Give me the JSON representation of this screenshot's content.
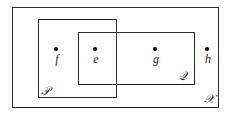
{
  "diagram": {
    "type": "set-venn-rectangles",
    "background_color": "#ffffff",
    "stroke_color": "#2b2b2b",
    "text_color": "#1c1c1c",
    "sets": [
      {
        "id": "universe",
        "label": "𝒳",
        "label_plain": "X",
        "label_position": "bottom-right-inside"
      },
      {
        "id": "p",
        "label": "𝒫",
        "label_plain": "P",
        "label_position": "bottom-left-inside"
      },
      {
        "id": "q",
        "label": "𝒬",
        "label_plain": "Q",
        "label_position": "bottom-right-inside"
      }
    ],
    "points": [
      {
        "id": "f",
        "label": "f",
        "membership": "P only"
      },
      {
        "id": "e",
        "label": "e",
        "membership": "P and Q"
      },
      {
        "id": "g",
        "label": "g",
        "membership": "Q only"
      },
      {
        "id": "h",
        "label": "h",
        "membership": "X only"
      }
    ]
  }
}
